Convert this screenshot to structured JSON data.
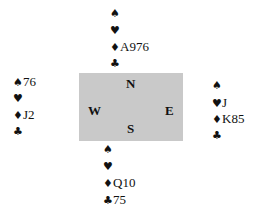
{
  "deal": {
    "compass": {
      "north": "N",
      "south": "S",
      "east": "E",
      "west": "W"
    },
    "suit_symbols": {
      "spades": "♠",
      "hearts": "♥",
      "diamonds": "♦",
      "clubs": "♣"
    },
    "hands": {
      "north": {
        "spades": "",
        "hearts": "",
        "diamonds": "A976",
        "clubs": ""
      },
      "west": {
        "spades": "76",
        "hearts": "",
        "diamonds": "J2",
        "clubs": ""
      },
      "east": {
        "spades": "",
        "hearts": "J",
        "diamonds": "K85",
        "clubs": ""
      },
      "south": {
        "spades": "",
        "hearts": "",
        "diamonds": "Q10",
        "clubs": "75"
      }
    },
    "colors": {
      "table_background": "#c9c9c9",
      "text": "#111111",
      "page_background": "#ffffff"
    }
  }
}
